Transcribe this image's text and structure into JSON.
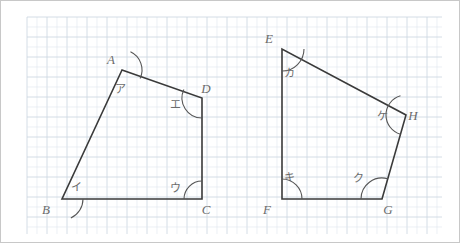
{
  "page": {
    "background_color": "#ffffff",
    "border_color": "#c8c8c8"
  },
  "grid": {
    "name": "graph-paper-grid",
    "x": 26,
    "y": 16,
    "width": 415,
    "height": 217,
    "minor_spacing": 10,
    "major_spacing": 20,
    "minor_color": "#dfe6ee",
    "major_color": "#c9d4e0"
  },
  "style": {
    "edge_color": "#3a3a3a",
    "edge_width": 1.6,
    "arc_color": "#555555",
    "label_color": "#6b6b6b"
  },
  "figures": [
    {
      "name": "quadrilateral-abcd",
      "id": "left",
      "vertices": [
        {
          "key": "A",
          "letter": "A",
          "x": 121,
          "y": 69,
          "label_x": 110,
          "label_y": 63,
          "angle_mark": "ア",
          "angle_label_x": 119,
          "angle_label_y": 92,
          "arc_radius": 20,
          "arc_start_deg": 295,
          "arc_end_deg": 25
        },
        {
          "key": "B",
          "letter": "B",
          "x": 61,
          "y": 198,
          "label_x": 45,
          "label_y": 213,
          "angle_mark": "イ",
          "angle_label_x": 75,
          "angle_label_y": 190,
          "arc_radius": 21,
          "arc_start_deg": 0,
          "arc_end_deg": 65
        },
        {
          "key": "C",
          "letter": "C",
          "x": 201,
          "y": 198,
          "label_x": 205,
          "label_y": 213,
          "angle_mark": "ウ",
          "angle_label_x": 174,
          "angle_label_y": 191,
          "arc_radius": 18,
          "arc_start_deg": 180,
          "arc_end_deg": 270
        },
        {
          "key": "D",
          "letter": "D",
          "x": 201,
          "y": 97,
          "label_x": 205,
          "label_y": 92,
          "angle_mark": "エ",
          "angle_label_x": 174,
          "angle_label_y": 107,
          "arc_radius": 20,
          "arc_start_deg": 90,
          "arc_end_deg": 205
        }
      ],
      "edges": [
        "A-B",
        "B-C",
        "C-D",
        "D-A"
      ]
    },
    {
      "name": "quadrilateral-efgh",
      "id": "right",
      "vertices": [
        {
          "key": "E",
          "letter": "E",
          "x": 281,
          "y": 48,
          "label_x": 268,
          "label_y": 42,
          "angle_mark": "カ",
          "angle_label_x": 288,
          "angle_label_y": 76,
          "arc_radius": 22,
          "arc_start_deg": 0,
          "arc_end_deg": 90
        },
        {
          "key": "F",
          "letter": "F",
          "x": 281,
          "y": 198,
          "label_x": 266,
          "label_y": 213,
          "angle_mark": "キ",
          "angle_label_x": 288,
          "angle_label_y": 180,
          "arc_radius": 20,
          "arc_start_deg": 270,
          "arc_end_deg": 360
        },
        {
          "key": "G",
          "letter": "G",
          "x": 381,
          "y": 198,
          "label_x": 387,
          "label_y": 213,
          "angle_mark": "ク",
          "angle_label_x": 357,
          "angle_label_y": 181,
          "arc_radius": 21,
          "arc_start_deg": 180,
          "arc_end_deg": 286
        },
        {
          "key": "H",
          "letter": "H",
          "x": 405,
          "y": 114,
          "label_x": 412,
          "label_y": 119,
          "angle_mark": "ケ",
          "angle_label_x": 381,
          "angle_label_y": 119,
          "arc_radius": 20,
          "arc_start_deg": 106,
          "arc_end_deg": 254
        }
      ],
      "edges": [
        "E-F",
        "F-G",
        "G-H",
        "H-E"
      ]
    }
  ]
}
